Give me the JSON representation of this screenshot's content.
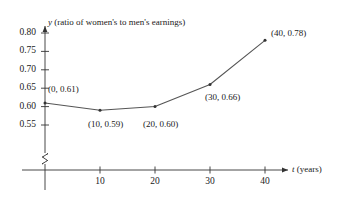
{
  "chart_data": {
    "type": "line",
    "title": "",
    "xlabel": "t (years)",
    "ylabel": "y (ratio of women's to men's earnings)",
    "y_axis_variable": "y",
    "y_axis_description": "(ratio of women's to men's earnings)",
    "x_axis_variable": "t",
    "x_axis_description": "(years)",
    "x": [
      0,
      10,
      20,
      30,
      40
    ],
    "values": [
      0.61,
      0.59,
      0.6,
      0.66,
      0.78
    ],
    "xlim": [
      0,
      44
    ],
    "ylim": [
      0.525,
      0.805
    ],
    "xticks": [
      10,
      20,
      30,
      40
    ],
    "xtick_labels": [
      "10",
      "20",
      "30",
      "40"
    ],
    "yticks": [
      0.55,
      0.6,
      0.65,
      0.7,
      0.75,
      0.8
    ],
    "ytick_labels": [
      "0.55",
      "0.60",
      "0.65",
      "0.70",
      "0.75",
      "0.80"
    ],
    "grid": false,
    "legend": false,
    "y_axis_break": true,
    "point_labels": [
      "(0, 0.61)",
      "(10, 0.59)",
      "(20, 0.60)",
      "(30, 0.66)",
      "(40, 0.78)"
    ],
    "line_color": "#555555",
    "marker_color": "#333333",
    "axis_color": "#333333",
    "background_color": "#ffffff"
  }
}
